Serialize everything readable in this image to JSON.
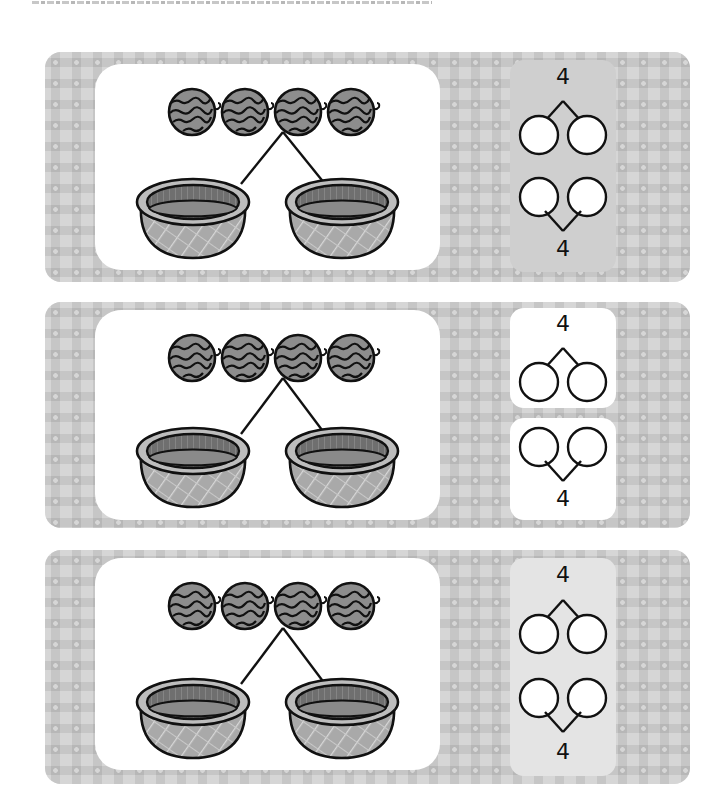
{
  "page": {
    "instruction_line": "（顶部说明文字被截断，仅露出字底部）",
    "background_color": "#ffffff"
  },
  "colors": {
    "panel_bg": "#d6d6d6",
    "panel_dot": "#ececec",
    "card_bg": "#ffffff",
    "bond_box_bg_grey": "#d3d3d3",
    "bond_box_bg_white": "#ffffff",
    "bond_box_bg_light": "#e6e6e6",
    "stroke": "#111111",
    "fruit_fill": "#8a8a8a",
    "basket_inner": "#7a7a7a",
    "basket_body": "#b0b0b0"
  },
  "exercises": [
    {
      "id": 1,
      "items": {
        "fruit": "watermelon",
        "count": 4
      },
      "containers": {
        "type": "basket",
        "count": 2
      },
      "bond_top": {
        "whole": "4",
        "part_left": "",
        "part_right": ""
      },
      "bond_bottom": {
        "whole": "4",
        "part_left": "",
        "part_right": ""
      },
      "bond_box_style": "grey"
    },
    {
      "id": 2,
      "items": {
        "fruit": "watermelon",
        "count": 4
      },
      "containers": {
        "type": "basket",
        "count": 2
      },
      "bond_top": {
        "whole": "4",
        "part_left": "",
        "part_right": ""
      },
      "bond_bottom": {
        "whole": "4",
        "part_left": "",
        "part_right": ""
      },
      "bond_box_style": "white"
    },
    {
      "id": 3,
      "items": {
        "fruit": "watermelon",
        "count": 4
      },
      "containers": {
        "type": "basket",
        "count": 2
      },
      "bond_top": {
        "whole": "4",
        "part_left": "",
        "part_right": ""
      },
      "bond_bottom": {
        "whole": "4",
        "part_left": "",
        "part_right": ""
      },
      "bond_box_style": "light"
    }
  ]
}
